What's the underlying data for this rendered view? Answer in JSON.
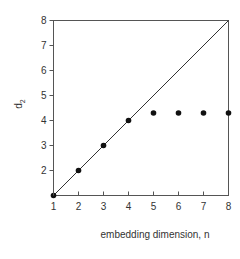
{
  "chart_data": {
    "type": "scatter",
    "title": "",
    "xlabel": "embedding dimension, n",
    "ylabel": "d",
    "ylabel_subscript": "2",
    "xlim": [
      1,
      8
    ],
    "ylim": [
      1,
      8
    ],
    "xticks": [
      "1",
      "2",
      "3",
      "4",
      "5",
      "6",
      "7",
      "8"
    ],
    "yticks": [
      "2",
      "3",
      "4",
      "5",
      "6",
      "7",
      "8"
    ],
    "grid": false,
    "legend": null,
    "series": [
      {
        "name": "d2",
        "type": "scatter",
        "x": [
          1,
          2,
          3,
          4,
          5,
          6,
          7,
          8
        ],
        "y": [
          1,
          2,
          3,
          4,
          4.3,
          4.3,
          4.3,
          4.3
        ]
      },
      {
        "name": "reference line d2 = n",
        "type": "line",
        "x": [
          1,
          8
        ],
        "y": [
          1,
          8
        ]
      }
    ]
  },
  "colors": {
    "axis": "#555555",
    "marker": "#111111",
    "line": "#333333",
    "text": "#333333"
  }
}
